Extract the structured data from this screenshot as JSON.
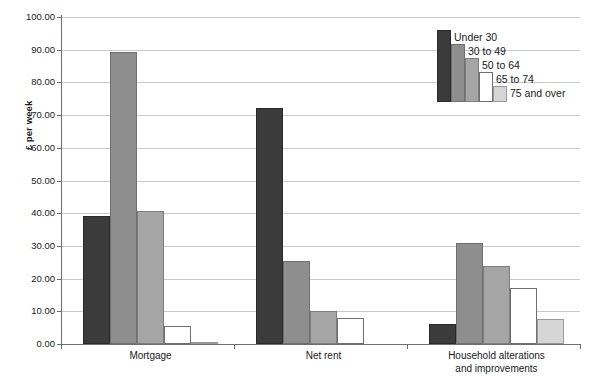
{
  "chart_data": {
    "type": "bar",
    "title": "",
    "subtitle": "",
    "xlabel": "",
    "ylabel": "£ per week",
    "ylim": [
      0,
      100
    ],
    "ytick_labels": [
      "100.00",
      "90.00",
      "80.00",
      "70.00",
      "60.00",
      "50.00",
      "40.00",
      "30.00",
      "20.00",
      "10.00",
      "0.00"
    ],
    "ytick_values": [
      100,
      90,
      80,
      70,
      60,
      50,
      40,
      30,
      20,
      10,
      0
    ],
    "grid": true,
    "legend_position": "top-right",
    "categories": [
      "Mortgage",
      "Net rent",
      "Household alterations\nand improvements"
    ],
    "series": [
      {
        "name": "Under 30",
        "color": "#3b3b3b",
        "values": [
          39.2,
          72.2,
          6.0
        ]
      },
      {
        "name": "30 to 49",
        "color": "#8e8e8e",
        "values": [
          89.2,
          25.5,
          30.9
        ]
      },
      {
        "name": "50 to 64",
        "color": "#a5a5a5",
        "values": [
          40.8,
          10.0,
          23.8
        ]
      },
      {
        "name": "65 to 74",
        "color": "#ffffff",
        "values": [
          5.5,
          8.0,
          17.0
        ]
      },
      {
        "name": "75 and over",
        "color": "#d6d6d6",
        "values": [
          0.5,
          0.0,
          7.5
        ]
      }
    ]
  }
}
